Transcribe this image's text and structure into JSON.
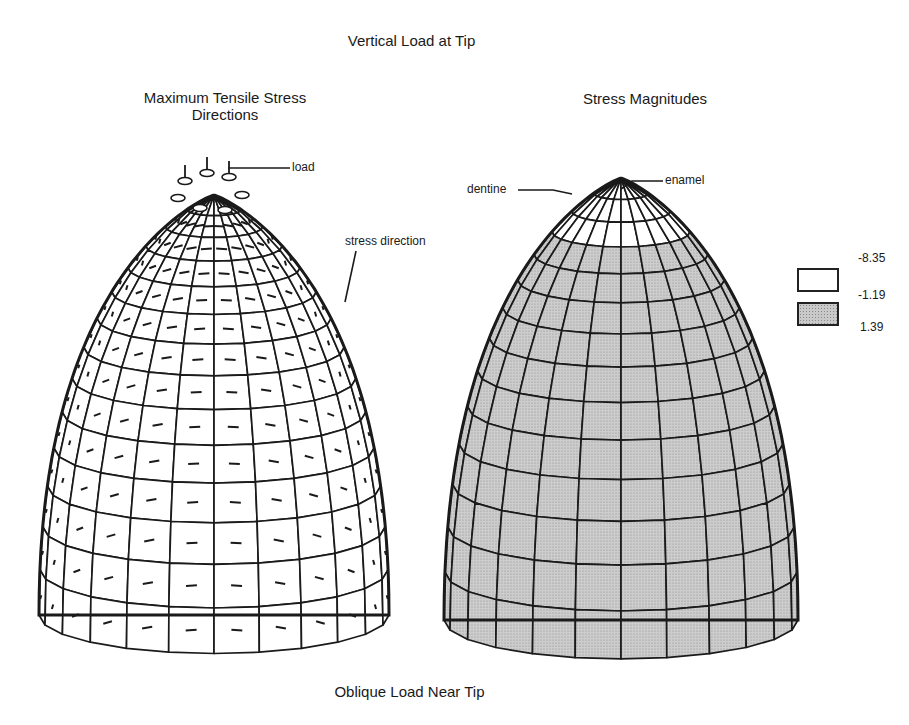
{
  "figure": {
    "title": "Vertical Load at Tip",
    "bottom_caption": "Oblique Load Near Tip"
  },
  "left_panel": {
    "title_line1": "Maximum Tensile Stress",
    "title_line2": "Directions",
    "annotations": {
      "load": "load",
      "stress_direction": "stress direction"
    },
    "mesh": {
      "fill": "#ffffff",
      "stroke": "#1a1a1a",
      "meridians": 24,
      "rings": 14,
      "stress_markers": true
    }
  },
  "right_panel": {
    "title": "Stress Magnitudes",
    "annotations": {
      "dentine": "dentine",
      "enamel": "enamel"
    },
    "mesh": {
      "fill": "#c9c9c9",
      "tip_fill": "#ffffff",
      "stroke": "#1a1a1a",
      "meridians": 24,
      "rings": 14,
      "stress_markers": false
    }
  },
  "legend": {
    "entries": [
      {
        "label": "white",
        "color": "#ffffff",
        "from": "-8.35",
        "to": "-1.19"
      },
      {
        "label": "dotted",
        "color": "#c9c9c9",
        "from": "-1.19",
        "to": "1.39"
      }
    ],
    "ticks": [
      "-8.35",
      "-1.19",
      "1.39"
    ]
  }
}
